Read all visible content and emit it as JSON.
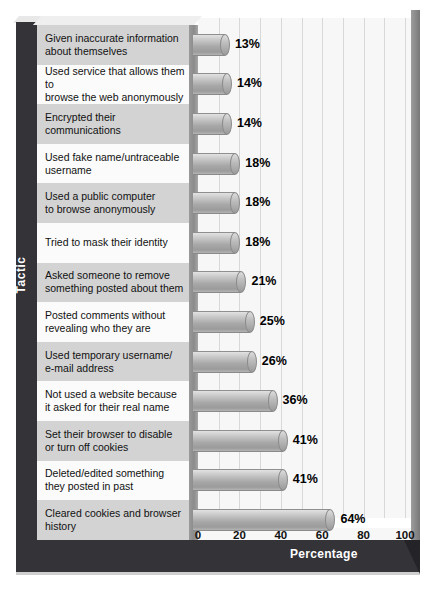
{
  "chart_data": {
    "type": "bar",
    "orientation": "horizontal",
    "title": "",
    "xlabel": "Percentage",
    "ylabel": "Tactic",
    "xlim": [
      0,
      100
    ],
    "xticks": [
      "0",
      "20",
      "40",
      "60",
      "80",
      "100"
    ],
    "grid": true,
    "gridline_step": 10,
    "legend": "none",
    "value_suffix": "%",
    "categories": [
      "Given inaccurate information about themselves",
      "Used service that allows them to browse the web anonymously",
      "Encrypted their communications",
      "Used fake name/untraceable username",
      "Used a public computer to browse anonymously",
      "Tried to mask their identity",
      "Asked someone to remove something posted about them",
      "Posted comments without revealing who they are",
      "Used temporary username/ e-mail address",
      "Not used a website because it asked for their real name",
      "Set their browser to disable or turn off cookies",
      "Deleted/edited something they posted in past",
      "Cleared cookies and browser history"
    ],
    "values": [
      13,
      14,
      14,
      18,
      18,
      18,
      21,
      25,
      26,
      36,
      41,
      41,
      64
    ],
    "value_labels": [
      "13%",
      "14%",
      "14%",
      "18%",
      "18%",
      "18%",
      "21%",
      "25%",
      "26%",
      "36%",
      "41%",
      "41%",
      "64%"
    ]
  },
  "rows": [
    {
      "line1": "Given inaccurate information",
      "line2": "about themselves",
      "value_label": "13%",
      "value": 13
    },
    {
      "line1": "Used service that allows them to",
      "line2": "browse the web anonymously",
      "value_label": "14%",
      "value": 14
    },
    {
      "line1": "Encrypted their communications",
      "line2": "",
      "value_label": "14%",
      "value": 14
    },
    {
      "line1": "Used fake name/untraceable",
      "line2": "username",
      "value_label": "18%",
      "value": 18
    },
    {
      "line1": "Used a public computer",
      "line2": "to browse anonymously",
      "value_label": "18%",
      "value": 18
    },
    {
      "line1": "Tried to mask their identity",
      "line2": "",
      "value_label": "18%",
      "value": 18
    },
    {
      "line1": "Asked someone to remove",
      "line2": "something posted about them",
      "value_label": "21%",
      "value": 21
    },
    {
      "line1": "Posted comments without",
      "line2": "revealing who they are",
      "value_label": "25%",
      "value": 25
    },
    {
      "line1": "Used temporary username/",
      "line2": "e-mail address",
      "value_label": "26%",
      "value": 26
    },
    {
      "line1": "Not used a website because",
      "line2": "it asked for their real name",
      "value_label": "36%",
      "value": 36
    },
    {
      "line1": "Set their browser to disable",
      "line2": "or turn off cookies",
      "value_label": "41%",
      "value": 41
    },
    {
      "line1": "Deleted/edited something",
      "line2": "they posted in past",
      "value_label": "41%",
      "value": 41
    },
    {
      "line1": "Cleared cookies and browser",
      "line2": "history",
      "value_label": "64%",
      "value": 64
    }
  ],
  "axes": {
    "y_title": "Tactic",
    "x_title": "Percentage",
    "x_ticks": [
      "0",
      "20",
      "40",
      "60",
      "80",
      "100"
    ]
  },
  "colors": {
    "frame": "#333338",
    "bar_fill": "#a8a8a8",
    "plot_background": "#f7f7f7",
    "label_shade": "#d3d3d3",
    "label_plain": "#fbfbfb",
    "gridline": "#d8d8d8",
    "text": "#111111",
    "frame_text": "#ffffff"
  }
}
